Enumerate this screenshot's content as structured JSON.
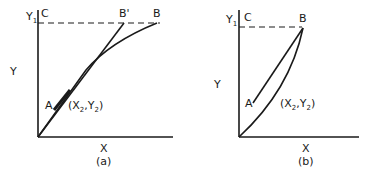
{
  "panels": [
    {
      "id": "a",
      "caption": "(a)",
      "axes": {
        "x_label": "X",
        "y_label": "Y"
      },
      "y_tick": {
        "label": "Y",
        "subscript": "1"
      },
      "points": {
        "C": "C",
        "B_prime": "B'",
        "B": "B",
        "A": "A"
      },
      "coord_label": {
        "open": "(X",
        "sub1": "2",
        "mid": ",Y",
        "sub2": "2",
        "close": ")"
      }
    },
    {
      "id": "b",
      "caption": "(b)",
      "axes": {
        "x_label": "X",
        "y_label": "Y"
      },
      "y_tick": {
        "label": "Y",
        "subscript": "1"
      },
      "points": {
        "C": "C",
        "B": "B",
        "A": "A"
      },
      "coord_label": {
        "open": "(X",
        "sub1": "2",
        "mid": ",Y",
        "sub2": "2",
        "close": ")"
      }
    }
  ]
}
